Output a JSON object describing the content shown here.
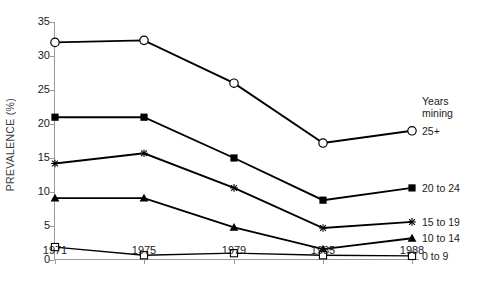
{
  "chart_data": {
    "type": "line",
    "title": "",
    "xlabel": "",
    "ylabel": "PREVALENCE (%)",
    "categories": [
      "1971",
      "1975",
      "1979",
      "1985",
      "1988"
    ],
    "xticklabels": [
      "1971",
      "1975",
      "1979",
      "1985",
      "1988"
    ],
    "yticklabels": [
      "0",
      "5",
      "10",
      "15",
      "20",
      "25",
      "30",
      "35"
    ],
    "yticks": [
      0,
      5,
      10,
      15,
      20,
      25,
      30,
      35
    ],
    "ylim": [
      0,
      35
    ],
    "grid": false,
    "legend_position": "right-inline",
    "legend_title": "Years mining",
    "series": [
      {
        "name": "25+",
        "label": "25+",
        "marker": "open-circle",
        "color": "#000000",
        "values": [
          32.0,
          32.3,
          26.0,
          17.2,
          19.0
        ]
      },
      {
        "name": "20 to 24",
        "label": "20 to 24",
        "marker": "filled-square",
        "color": "#000000",
        "values": [
          21.0,
          21.0,
          15.0,
          8.8,
          10.6
        ]
      },
      {
        "name": "15 to 19",
        "label": "15 to 19",
        "marker": "cross",
        "color": "#000000",
        "values": [
          14.2,
          15.7,
          10.6,
          4.7,
          5.6
        ]
      },
      {
        "name": "10 to 14",
        "label": "10 to 14",
        "marker": "filled-triangle",
        "color": "#000000",
        "values": [
          9.1,
          9.1,
          4.8,
          1.6,
          3.2
        ]
      },
      {
        "name": "0 to 9",
        "label": "0 to 9",
        "marker": "open-square",
        "color": "#000000",
        "values": [
          1.9,
          0.7,
          1.0,
          0.7,
          0.6
        ]
      }
    ]
  },
  "legend": {
    "header_line_1": "Years",
    "header_line_2": "mining",
    "entries": [
      "25+",
      "20 to 24",
      "15 to 19",
      "10 to 14",
      "0 to 9"
    ]
  },
  "axes": {
    "y_axis_title": "PREVALENCE (%)"
  }
}
